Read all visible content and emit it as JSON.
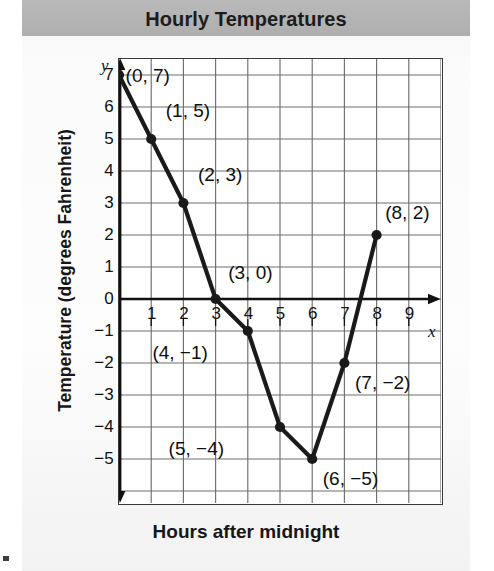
{
  "title": "Hourly Temperatures",
  "axes": {
    "y_title": "Temperature (degrees Fahrenheit)",
    "x_title": "Hours after midnight",
    "x_letter": "x",
    "y_letter": "y"
  },
  "colors": {
    "title_band": "#b6b6b6",
    "line": "#1a1a1a",
    "marker": "#1a1a1a",
    "grid": "#6e6e6e",
    "axis": "#111111",
    "frame": "#3a3a3a",
    "plot_bg": "#ffffff"
  },
  "ticks": {
    "y": [
      "7",
      "6",
      "5",
      "4",
      "3",
      "2",
      "1",
      "0",
      "−1",
      "−2",
      "−3",
      "−4",
      "−5"
    ],
    "x": [
      "1",
      "2",
      "3",
      "4",
      "5",
      "6",
      "7",
      "8",
      "9"
    ]
  },
  "point_labels": [
    "(0, 7)",
    "(1, 5)",
    "(2, 3)",
    "(3, 0)",
    "(4, −1)",
    "(5, −4)",
    "(6, −5)",
    "(7, −2)",
    "(8, 2)"
  ],
  "chart_data": {
    "type": "line",
    "title": "Hourly Temperatures",
    "xlabel": "Hours after midnight",
    "ylabel": "Temperature (degrees Fahrenheit)",
    "x": [
      0,
      1,
      2,
      3,
      4,
      5,
      6,
      7,
      8
    ],
    "values": [
      7,
      5,
      3,
      0,
      -1,
      -4,
      -5,
      -2,
      2
    ],
    "point_labels": [
      "(0, 7)",
      "(1, 5)",
      "(2, 3)",
      "(3, 0)",
      "(4, −1)",
      "(5, −4)",
      "(6, −5)",
      "(7, −2)",
      "(8, 2)"
    ],
    "xlim": [
      0,
      10
    ],
    "ylim": [
      -6,
      7.5
    ],
    "xticks": [
      1,
      2,
      3,
      4,
      5,
      6,
      7,
      8,
      9
    ],
    "yticks": [
      7,
      6,
      5,
      4,
      3,
      2,
      1,
      0,
      -1,
      -2,
      -3,
      -4,
      -5
    ],
    "grid": true,
    "legend": "none",
    "markers": true,
    "marker_style": "filled-circle"
  }
}
